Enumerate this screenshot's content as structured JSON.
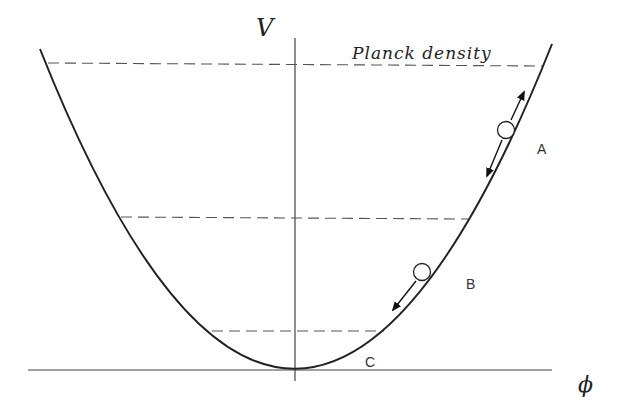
{
  "diagram": {
    "axes": {
      "y_label": "V",
      "x_label": "ϕ"
    },
    "levels": [
      {
        "name": "planck-density",
        "label": "Planck density",
        "y": 64
      },
      {
        "name": "middle-level",
        "label": "",
        "y": 218
      },
      {
        "name": "low-level",
        "label": "",
        "y": 331
      }
    ],
    "regions": [
      {
        "name": "A",
        "label": "A"
      },
      {
        "name": "B",
        "label": "B"
      },
      {
        "name": "C",
        "label": "C"
      }
    ],
    "colors": {
      "curve": "#222222",
      "axis": "#444444",
      "dashes": "#555555",
      "background": "#ffffff"
    }
  }
}
